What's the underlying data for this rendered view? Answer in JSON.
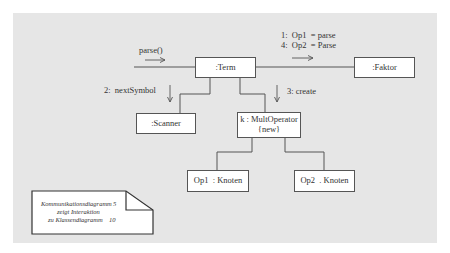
{
  "diagram": {
    "type": "UML communication diagram",
    "objects": {
      "term": {
        "label": ":Term"
      },
      "faktor": {
        "label": ":Faktor"
      },
      "scanner": {
        "label": ":Scanner"
      },
      "multoperator": {
        "label": "k : MultOperator",
        "constraint": "{new}"
      },
      "op1": {
        "label": "Op1  : Knoten"
      },
      "op2": {
        "label": "Op2  . Knoten"
      }
    },
    "messages": {
      "parse": "parse()",
      "next_symbol": "2:  nextSymbol",
      "create": "3: create",
      "op1_parse": "1:  Op1  = parse",
      "op2_parse": "4:  Op2  = Parse"
    },
    "note": {
      "line1": "Kommunikationsdiagramm",
      "line1_num": "5",
      "line2": "zeigt  Interaktion",
      "line3": "zu Klassendiagramm",
      "line3_num": "10"
    },
    "colors": {
      "background": "#e6e6e6",
      "box_fill": "#ffffff",
      "line": "#555555"
    }
  }
}
